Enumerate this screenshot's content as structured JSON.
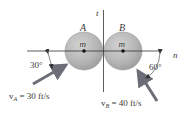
{
  "diagram": {
    "axes": {
      "n_label": "n",
      "t_label": "t"
    },
    "spheres": [
      {
        "id": "A",
        "label": "A",
        "mass_label": "m"
      },
      {
        "id": "B",
        "label": "B",
        "mass_label": "m"
      }
    ],
    "velocities": {
      "A": {
        "symbol": "v",
        "subscript": "A",
        "text": " = 30 ft/s",
        "angle_label": "30°"
      },
      "B": {
        "symbol": "v",
        "subscript": "B",
        "text": " = 40 ft/s",
        "angle_label": "60°"
      }
    },
    "colors": {
      "sphere_fill": "#b4b4b4",
      "sphere_edge": "#9a9a9a",
      "arrow": "#6b6e76",
      "axis": "#333333",
      "text": "#3a3a3a"
    }
  }
}
